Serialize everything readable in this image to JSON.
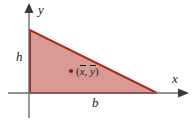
{
  "figure": {
    "name": "triangle-centroid-diagram",
    "background_color": "#ffffff",
    "axes": {
      "color": "#6e6e72",
      "x_axis_label": "x",
      "y_axis_label": "y",
      "x_axis_y_px": 93,
      "y_axis_x_px": 29
    },
    "shape": {
      "type": "right-triangle",
      "fill_color": "#d99a93",
      "stroke_color": "#a52a20",
      "vertices_px": [
        [
          30,
          30
        ],
        [
          30,
          93
        ],
        [
          157,
          93
        ]
      ]
    },
    "labels": {
      "height": "h",
      "base": "b",
      "centroid_open": "(",
      "centroid_x": "x",
      "centroid_comma": ", ",
      "centroid_y": "y",
      "centroid_close": ")"
    },
    "centroid_point": {
      "color": "#8b2018",
      "x_px": 71,
      "y_px": 71
    }
  }
}
